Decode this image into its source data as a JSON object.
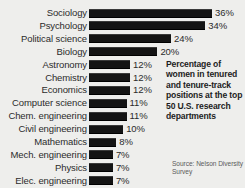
{
  "chart_data": {
    "type": "bar",
    "orientation": "horizontal",
    "title": "",
    "xlabel": "",
    "ylabel": "",
    "xlim": [
      0,
      40
    ],
    "grid": false,
    "legend": "none",
    "value_suffix": "%",
    "categories": [
      "Sociology",
      "Psychology",
      "Political science",
      "Biology",
      "Astronomy",
      "Chemistry",
      "Economics",
      "Computer science",
      "Chem. engineering",
      "Civil engineering",
      "Mathematics",
      "Mech. engineering",
      "Physics",
      "Elec. engineering"
    ],
    "values": [
      36,
      34,
      24,
      20,
      12,
      12,
      12,
      11,
      11,
      10,
      8,
      7,
      7,
      7
    ],
    "value_labels": [
      "36%",
      "34%",
      "24%",
      "20%",
      "12%",
      "12%",
      "12%",
      "11%",
      "11%",
      "10%",
      "8%",
      "7%",
      "7%",
      "7%"
    ],
    "bar_color": "#141414",
    "background_color": "#eeeeec",
    "text_color": "#2b2b2b"
  },
  "caption": {
    "text": "Percentage of women in tenured and tenure-track positions at the top 50 U.S. research departments"
  },
  "source": {
    "text": "Source: Nelson Diversity Survey"
  }
}
